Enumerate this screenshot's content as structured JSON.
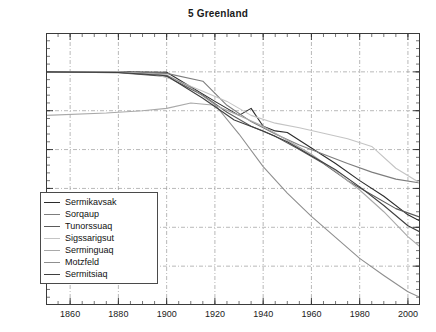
{
  "chart_data": {
    "type": "line",
    "title": "5 Greenland",
    "xlabel": "",
    "ylabel": "",
    "xlim": [
      1850,
      2005
    ],
    "ylim": [
      -3000,
      500
    ],
    "xticks": [
      1860,
      1880,
      1900,
      1920,
      1940,
      1960,
      1980,
      2000
    ],
    "yticks": [
      500,
      0,
      -500,
      -1000,
      -1500,
      -2000,
      -2500,
      -3000
    ],
    "xtick_minor_step": 5,
    "ytick_minor_step": 100,
    "grid": true,
    "grid_style": "dash-dot",
    "legend_position": "lower-left",
    "series": [
      {
        "name": "Sermikavsak",
        "color": "#2b2b2b",
        "x": [
          1850,
          1880,
          1900,
          1920,
          1930,
          1935,
          1940,
          1945,
          1950,
          1960,
          1970,
          1980,
          1990,
          2000,
          2005
        ],
        "values": [
          0,
          0,
          -5,
          -380,
          -560,
          -470,
          -700,
          -760,
          -780,
          -980,
          -1180,
          -1400,
          -1600,
          -1840,
          -1920
        ]
      },
      {
        "name": "Sorqaup",
        "color": "#7d7d7d",
        "x": [
          1850,
          1880,
          1900,
          1915,
          1925,
          1935,
          1945,
          1955,
          1965,
          1975,
          1985,
          1995,
          2005
        ],
        "values": [
          0,
          -5,
          -20,
          -120,
          -430,
          -640,
          -800,
          -940,
          -1060,
          -1180,
          -1290,
          -1380,
          -1430
        ]
      },
      {
        "name": "Tunorssuaq",
        "color": "#5a5a5a",
        "x": [
          1850,
          1880,
          1900,
          1915,
          1925,
          1935,
          1945,
          1955,
          1965,
          1975,
          1985,
          1995,
          2005
        ],
        "values": [
          0,
          -10,
          -60,
          -300,
          -520,
          -700,
          -830,
          -1000,
          -1180,
          -1400,
          -1580,
          -1760,
          -1870
        ]
      },
      {
        "name": "Sigssarigsut",
        "color": "#c4c4c4",
        "x": [
          1850,
          1880,
          1895,
          1905,
          1915,
          1925,
          1935,
          1945,
          1955,
          1965,
          1975,
          1985,
          1995,
          2005
        ],
        "values": [
          0,
          0,
          -30,
          -120,
          -250,
          -380,
          -560,
          -660,
          -720,
          -790,
          -860,
          -960,
          -1240,
          -1430
        ]
      },
      {
        "name": "Serminguaq",
        "color": "#a9a9a9",
        "x": [
          1850,
          1875,
          1890,
          1900,
          1910,
          1920,
          1930,
          1940,
          1950,
          1960,
          1970,
          1980,
          1990,
          2000,
          2005
        ],
        "values": [
          -560,
          -530,
          -500,
          -470,
          -400,
          -430,
          -560,
          -700,
          -880,
          -1060,
          -1280,
          -1520,
          -1800,
          -2120,
          -2250
        ]
      },
      {
        "name": "Motzfeld",
        "color": "#8f8f8f",
        "x": [
          1850,
          1880,
          1900,
          1910,
          1920,
          1930,
          1940,
          1950,
          1960,
          1970,
          1980,
          1990,
          2000,
          2005
        ],
        "values": [
          0,
          -5,
          -40,
          -200,
          -420,
          -800,
          -1220,
          -1560,
          -1860,
          -2130,
          -2400,
          -2620,
          -2830,
          -2900
        ]
      },
      {
        "name": "Sermitsiaq",
        "color": "#3f3f3f",
        "x": [
          1850,
          1880,
          1900,
          1915,
          1928,
          1940,
          1950,
          1960,
          1970,
          1980,
          1990,
          2000,
          2005
        ],
        "values": [
          0,
          -8,
          -50,
          -340,
          -620,
          -760,
          -900,
          -1080,
          -1260,
          -1480,
          -1720,
          -1980,
          -2060
        ]
      }
    ]
  },
  "axis": {
    "ytick_labels": [
      "500",
      "0",
      "-500",
      "-1000",
      "-1500",
      "-2000",
      "-2500",
      "-3000"
    ],
    "xtick_labels": [
      "1860",
      "1880",
      "1900",
      "1920",
      "1940",
      "1960",
      "1980",
      "2000"
    ]
  }
}
